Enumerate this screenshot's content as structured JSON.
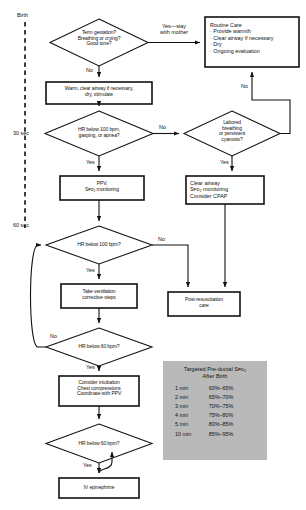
{
  "timeline": {
    "name": "time-axis",
    "marks": [
      {
        "id": "birth",
        "label": "Birth"
      },
      {
        "id": "30sec",
        "label": "30 sec"
      },
      {
        "id": "60sec",
        "label": "60 sec"
      }
    ]
  },
  "nodes": {
    "assessment": {
      "type": "decision",
      "lines": [
        "Term gestation?",
        "Breathing or crying?",
        "Good tone?"
      ]
    },
    "routine_care": {
      "type": "process",
      "heading": "Routine Care",
      "bullets": [
        "· Provide warmth",
        "· Clear airway if necessary",
        "· Dry",
        "· Ongoing evaluation"
      ]
    },
    "warm": {
      "type": "process",
      "lines": [
        "Warm, clear airway if necessary,",
        "dry, stimulate"
      ]
    },
    "hr100_apnea": {
      "type": "decision",
      "lines": [
        "HR below 100 bpm,",
        "gasping, or apnea?"
      ]
    },
    "labored": {
      "type": "decision",
      "lines": [
        "Labored",
        "breathing",
        "or persistent",
        "cyanosis?"
      ]
    },
    "ppv": {
      "type": "process",
      "lines": [
        "PPV,",
        "Sᴘo₂ monitoring"
      ]
    },
    "clear_airway": {
      "type": "process",
      "lines": [
        "Clear airway",
        "Sᴘo₂ monitoring",
        "Consider CPAP"
      ]
    },
    "hr100": {
      "type": "decision",
      "lines": [
        "HR below 100 bpm?"
      ]
    },
    "corrective": {
      "type": "process",
      "lines": [
        "Take ventilation",
        "corrective steps"
      ]
    },
    "post_resus": {
      "type": "process",
      "lines": [
        "Post-resuscitation",
        "care"
      ]
    },
    "hr60_a": {
      "type": "decision",
      "lines": [
        "HR below 60 bpm?"
      ]
    },
    "intubation": {
      "type": "process",
      "lines": [
        "Consider intubation",
        "Chest compressions",
        "Coordinate with PPV"
      ]
    },
    "hr60_b": {
      "type": "decision",
      "lines": [
        "HR below 60 bpm?"
      ]
    },
    "epinephrine": {
      "type": "process",
      "lines": [
        "IV epinephrine"
      ]
    }
  },
  "edge_labels": {
    "assessment_yes": [
      "Yes—stay",
      "with mother"
    ],
    "assessment_no": "No",
    "hr100_apnea_no": "No",
    "hr100_apnea_yes": "Yes",
    "labored_no": "No",
    "labored_yes": "Yes",
    "hr100_no": "No",
    "hr100_yes": "Yes",
    "hr60_a_no": "No",
    "hr60_a_yes": "Yes",
    "hr60_b_yes": "Yes"
  },
  "spo2_table": {
    "caption": [
      "Targeted Pre-ductal Sᴘo₂",
      "After Birth"
    ],
    "rows": [
      {
        "time": "1 min",
        "range": "60%–65%"
      },
      {
        "time": "2 min",
        "range": "65%–70%"
      },
      {
        "time": "3 min",
        "range": "70%–75%"
      },
      {
        "time": "4 min",
        "range": "75%–80%"
      },
      {
        "time": "5 min",
        "range": "80%–85%"
      },
      {
        "time": "10 min",
        "range": "85%–95%"
      }
    ],
    "background": "#b9b9b9"
  },
  "colors": {
    "stroke": "#111111",
    "background": "#ffffff",
    "panel": "#b9b9b9"
  }
}
